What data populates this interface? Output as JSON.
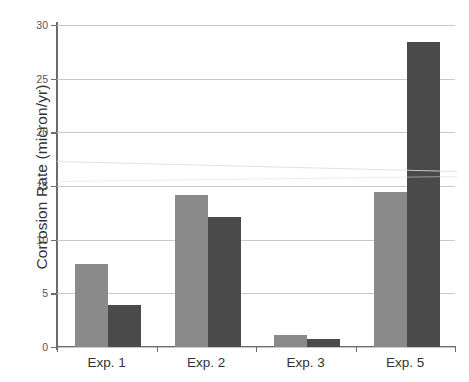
{
  "chart_data": {
    "type": "bar",
    "title": "",
    "xlabel": "",
    "ylabel": "Corrosion Rate (micron/yr)",
    "categories": [
      "Exp. 1",
      "Exp. 2",
      "Exp. 3",
      "Exp. 5"
    ],
    "series": [
      {
        "name": "series-1",
        "color": "#8a8a8a",
        "values": [
          7.7,
          14.2,
          1.1,
          14.4
        ]
      },
      {
        "name": "series-2",
        "color": "#4a4a4a",
        "values": [
          3.9,
          12.1,
          0.75,
          28.4
        ]
      }
    ],
    "ylim": [
      0,
      30
    ],
    "yticks": [
      0,
      5,
      10,
      15,
      20,
      25,
      30
    ],
    "ytick_labels": [
      "0",
      "5",
      "10",
      "15",
      "20",
      "25",
      "30"
    ],
    "grid": true,
    "legend": "none",
    "colors": {
      "light_bar": "#8a8a8a",
      "dark_bar": "#4a4a4a",
      "gridline": "#c8c8c8",
      "axis": "#6b6b6b",
      "text": "#333333",
      "background": "#ffffff"
    }
  }
}
